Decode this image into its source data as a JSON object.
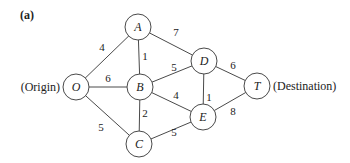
{
  "figure": {
    "panel_label": "(a)",
    "origin_label": "(Origin)",
    "destination_label": "(Destination)",
    "colors": {
      "stroke": "#4a4a4a",
      "text": "#222222",
      "background": "#ffffff"
    }
  },
  "nodes": [
    {
      "id": "A",
      "label": "A",
      "x": 138,
      "y": 27
    },
    {
      "id": "D",
      "label": "D",
      "x": 204,
      "y": 61
    },
    {
      "id": "O",
      "label": "O",
      "x": 76,
      "y": 87
    },
    {
      "id": "B",
      "label": "B",
      "x": 140,
      "y": 87
    },
    {
      "id": "T",
      "label": "T",
      "x": 257,
      "y": 86
    },
    {
      "id": "E",
      "label": "E",
      "x": 203,
      "y": 117
    },
    {
      "id": "C",
      "label": "C",
      "x": 139,
      "y": 144
    }
  ],
  "edges": [
    {
      "from": "O",
      "to": "A",
      "weight": "4",
      "lx": 102,
      "ly": 51
    },
    {
      "from": "A",
      "to": "D",
      "weight": "7",
      "lx": 176,
      "ly": 36
    },
    {
      "from": "A",
      "to": "B",
      "weight": "1",
      "lx": 145,
      "ly": 60
    },
    {
      "from": "B",
      "to": "D",
      "weight": "5",
      "lx": 174,
      "ly": 71
    },
    {
      "from": "O",
      "to": "B",
      "weight": "6",
      "lx": 108,
      "ly": 82
    },
    {
      "from": "D",
      "to": "T",
      "weight": "6",
      "lx": 233,
      "ly": 69
    },
    {
      "from": "B",
      "to": "E",
      "weight": "4",
      "lx": 176,
      "ly": 99
    },
    {
      "from": "D",
      "to": "E",
      "weight": "1",
      "lx": 209,
      "ly": 101
    },
    {
      "from": "E",
      "to": "T",
      "weight": "8",
      "lx": 233,
      "ly": 115
    },
    {
      "from": "B",
      "to": "C",
      "weight": "2",
      "lx": 145,
      "ly": 117
    },
    {
      "from": "O",
      "to": "C",
      "weight": "5",
      "lx": 101,
      "ly": 131
    },
    {
      "from": "C",
      "to": "E",
      "weight": "5",
      "lx": 174,
      "ly": 136
    }
  ]
}
